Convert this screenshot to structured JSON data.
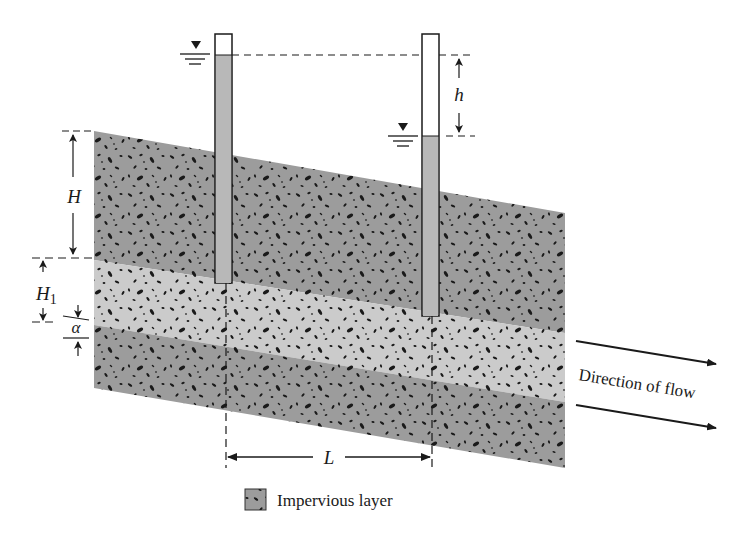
{
  "diagram": {
    "labels": {
      "H": "H",
      "H1_main": "H",
      "H1_sub": "1",
      "alpha": "α",
      "h": "h",
      "L": "L",
      "flow": "Direction of flow"
    },
    "legend": {
      "label": "Impervious layer"
    },
    "colors": {
      "impervious": "#9c9c9c",
      "permeable": "#c8c8c8",
      "tube_water": "#b8b8b8",
      "speck": "#1a1a1a",
      "line": "#1a1a1a"
    },
    "piezometers": [
      {
        "name": "upstream",
        "water_level": "high"
      },
      {
        "name": "downstream",
        "water_level": "low"
      }
    ]
  }
}
